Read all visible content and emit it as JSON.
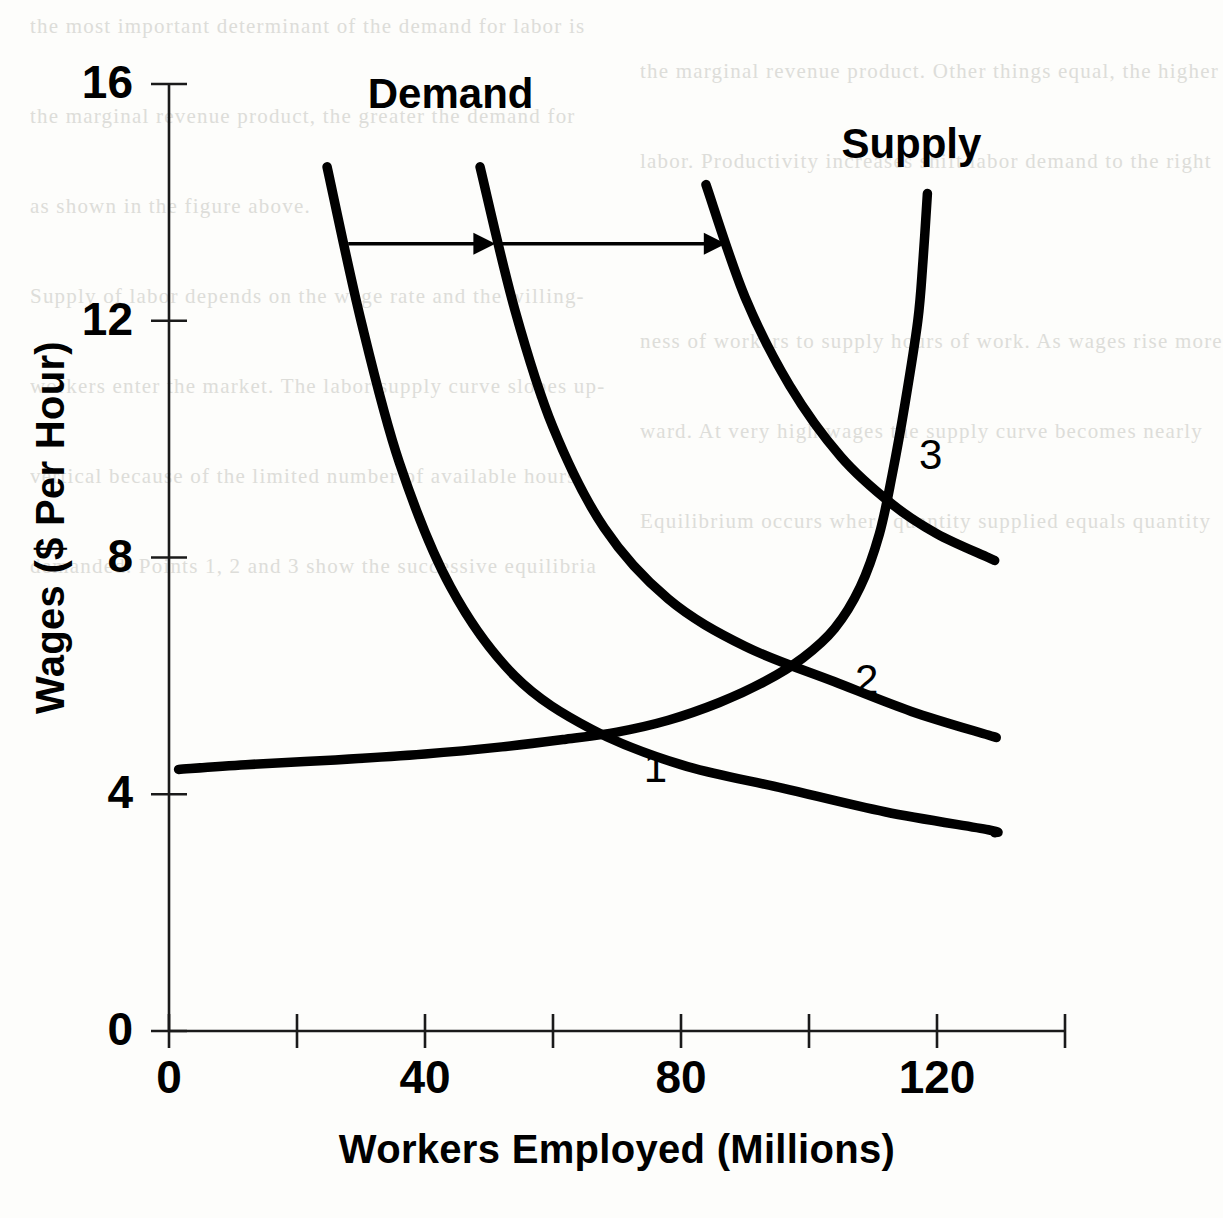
{
  "chart_data": {
    "type": "line",
    "title": "",
    "xlabel": "Workers Employed (Millions)",
    "ylabel": "Wages ($ Per Hour)",
    "xlim": [
      0,
      140
    ],
    "ylim": [
      0,
      16
    ],
    "xticks": [
      0,
      20,
      40,
      60,
      80,
      100,
      120,
      140
    ],
    "xtick_labels": [
      "0",
      "40",
      "80",
      "120"
    ],
    "xtick_label_values": [
      0,
      40,
      80,
      120
    ],
    "yticks": [
      0,
      4,
      8,
      12,
      16
    ],
    "ytick_labels": [
      "0",
      "4",
      "8",
      "12",
      "16"
    ],
    "grid": false,
    "legend": "inline-curve-labels",
    "series": [
      {
        "name": "Demand 1",
        "label": "Demand",
        "role": "demand",
        "points": [
          [
            24.7,
            14.6
          ],
          [
            30,
            12.0
          ],
          [
            36,
            9.6
          ],
          [
            44,
            7.5
          ],
          [
            54,
            6.0
          ],
          [
            66,
            5.1
          ],
          [
            80,
            4.5
          ],
          [
            96,
            4.1
          ],
          [
            112,
            3.7
          ],
          [
            128,
            3.4
          ],
          [
            129,
            3.35
          ]
        ]
      },
      {
        "name": "Demand 2",
        "label": "",
        "role": "demand",
        "points": [
          [
            48.6,
            14.6
          ],
          [
            54,
            12.2
          ],
          [
            60,
            10.2
          ],
          [
            68,
            8.5
          ],
          [
            78,
            7.3
          ],
          [
            90,
            6.5
          ],
          [
            104,
            5.9
          ],
          [
            116,
            5.4
          ],
          [
            128,
            5.0
          ],
          [
            129,
            4.97
          ]
        ]
      },
      {
        "name": "Demand 3",
        "label": "",
        "role": "demand",
        "points": [
          [
            83.9,
            14.3
          ],
          [
            90,
            12.4
          ],
          [
            97,
            10.9
          ],
          [
            105,
            9.7
          ],
          [
            113,
            8.9
          ],
          [
            120,
            8.4
          ],
          [
            128,
            8.0
          ],
          [
            129,
            7.95
          ]
        ]
      },
      {
        "name": "Supply",
        "label": "Supply",
        "role": "supply",
        "points": [
          [
            1.5,
            4.42
          ],
          [
            12,
            4.5
          ],
          [
            26,
            4.58
          ],
          [
            40,
            4.68
          ],
          [
            52,
            4.8
          ],
          [
            62,
            4.93
          ],
          [
            70,
            5.05
          ],
          [
            78,
            5.25
          ],
          [
            86,
            5.55
          ],
          [
            93,
            5.9
          ],
          [
            99,
            6.3
          ],
          [
            104,
            6.8
          ],
          [
            108,
            7.5
          ],
          [
            111,
            8.4
          ],
          [
            113,
            9.4
          ],
          [
            115,
            10.6
          ],
          [
            117,
            12.0
          ],
          [
            117.8,
            13.0
          ],
          [
            118.5,
            14.15
          ]
        ]
      }
    ],
    "equilibria": [
      {
        "label": "1",
        "x": 72,
        "y": 5.1,
        "label_x": 76,
        "label_y": 4.2
      },
      {
        "label": "2",
        "x": 104,
        "y": 6.6,
        "label_x": 109,
        "label_y": 5.7
      },
      {
        "label": "3",
        "x": 114,
        "y": 10.3,
        "label_x": 119,
        "label_y": 9.5
      }
    ],
    "shift_arrows": [
      {
        "name": "demand-shift-arrow-1",
        "x_start": 28,
        "x_end": 51,
        "y": 13.3
      },
      {
        "name": "demand-shift-arrow-2",
        "x_start": 52,
        "x_end": 87,
        "y": 13.3
      }
    ],
    "curve_labels": [
      {
        "name": "demand-label",
        "text": "Demand",
        "x": 44.0,
        "y": 15.6
      },
      {
        "name": "supply-label",
        "text": "Supply",
        "x": 116.0,
        "y": 14.75
      }
    ],
    "colors": {
      "curve": "#000000",
      "axis": "#1a1a1a",
      "background": "#fdfdfb",
      "text": "#000000"
    }
  },
  "background_text": {
    "lines": [
      "the most important determinant of the demand for labor is",
      "the marginal revenue product. Other things equal, the higher",
      "the marginal revenue product, the greater the demand for",
      "labor. Productivity increases shift labor demand to the right",
      "as shown in the figure above.",
      "",
      "Supply of labor depends on the wage rate and the willing-",
      "ness of workers to supply hours of work. As wages rise more",
      "workers enter the market. The labor supply curve slopes up-",
      "ward. At very high wages the supply curve becomes nearly",
      "vertical because of the limited number of available hours.",
      "Equilibrium occurs where quantity supplied equals quantity",
      "demanded. Points 1, 2 and 3 show the successive equilibria"
    ]
  }
}
